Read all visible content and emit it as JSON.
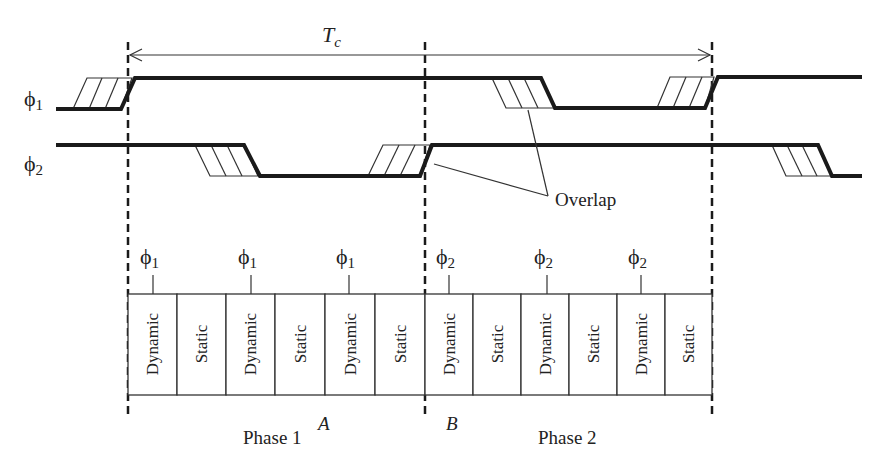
{
  "diagram": {
    "period_label": "T",
    "period_subscript": "c",
    "signals": [
      {
        "name": "phi1",
        "symbol": "ϕ",
        "subscript": "1"
      },
      {
        "name": "phi2",
        "symbol": "ϕ",
        "subscript": "2"
      }
    ],
    "overlap_label": "Overlap",
    "stage_clocks": [
      {
        "symbol": "ϕ",
        "subscript": "1"
      },
      {
        "symbol": "ϕ",
        "subscript": "1"
      },
      {
        "symbol": "ϕ",
        "subscript": "1"
      },
      {
        "symbol": "ϕ",
        "subscript": "2"
      },
      {
        "symbol": "ϕ",
        "subscript": "2"
      },
      {
        "symbol": "ϕ",
        "subscript": "2"
      }
    ],
    "cells": [
      "Dynamic",
      "Static",
      "Dynamic",
      "Static",
      "Dynamic",
      "Static",
      "Dynamic",
      "Static",
      "Dynamic",
      "Static",
      "Dynamic",
      "Static"
    ],
    "phase1_label": "Phase 1",
    "phase2_label": "Phase 2",
    "point_a": "A",
    "point_b": "B"
  }
}
